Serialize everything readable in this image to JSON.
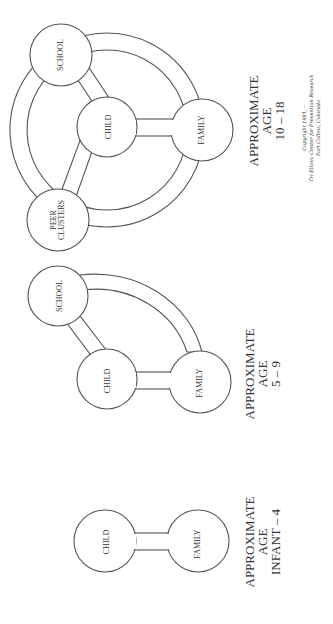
{
  "figure": {
    "diagrams": [
      {
        "id": "age-10-18",
        "nodes": [
          "SCHOOL",
          "CHILD",
          "FAMILY",
          "PEER",
          "CLUSTERS"
        ],
        "caption": [
          "APPROXIMATE",
          "AGE",
          "10 – 18"
        ]
      },
      {
        "id": "age-5-9",
        "nodes": [
          "SCHOOL",
          "CHILD",
          "FAMILY"
        ],
        "caption": [
          "APPROXIMATE",
          "AGE",
          "5 – 9"
        ]
      },
      {
        "id": "age-infant-4",
        "nodes": [
          "CHILD",
          "FAMILY"
        ],
        "caption": [
          "APPROXIMATE",
          "AGE",
          "INFANT – 4"
        ]
      }
    ],
    "copyright": [
      "Copyright 1991, –",
      "Tri-Ethnic Center for Prevention Research",
      "Fort Collins, Colorado"
    ]
  }
}
